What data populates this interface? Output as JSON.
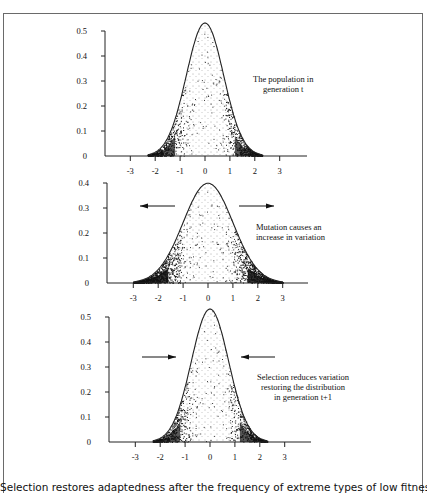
{
  "figure": {
    "caption": "Selection restores adaptedness after the frequency of extreme types of low fitness"
  },
  "panels": [
    {
      "annotation_lines": [
        "The population in",
        "generation t"
      ],
      "arrows": "none"
    },
    {
      "annotation_lines": [
        "Mutation causes an",
        "increase in variation"
      ],
      "arrows": "outward"
    },
    {
      "annotation_lines": [
        "Selection reduces variation",
        "restoring the distribution",
        "in generation t+1"
      ],
      "arrows": "inward"
    }
  ],
  "chart_data": [
    {
      "type": "area",
      "title": "The population in generation t",
      "xlabel": "",
      "ylabel": "",
      "x_ticks": [
        -3,
        -2,
        -1,
        0,
        1,
        2,
        3
      ],
      "y_ticks": [
        0,
        0.1,
        0.2,
        0.3,
        0.4,
        0.5
      ],
      "ylim": [
        0,
        0.5
      ],
      "series": [
        {
          "name": "normal density",
          "mean": 0,
          "sd": 0.75,
          "peak": 0.53
        }
      ],
      "annotations": [
        "The population in generation t"
      ],
      "grid": false
    },
    {
      "type": "area",
      "title": "Mutation causes an increase in variation",
      "xlabel": "",
      "ylabel": "",
      "x_ticks": [
        -3,
        -2,
        -1,
        0,
        1,
        2,
        3
      ],
      "y_ticks": [
        0,
        0.1,
        0.2,
        0.3,
        0.4
      ],
      "ylim": [
        0,
        0.4
      ],
      "series": [
        {
          "name": "normal density",
          "mean": 0,
          "sd": 1.0,
          "peak": 0.4
        }
      ],
      "annotations": [
        "Mutation causes an increase in variation",
        "arrows pointing outward"
      ],
      "grid": false
    },
    {
      "type": "area",
      "title": "Selection reduces variation restoring the distribution in generation t+1",
      "xlabel": "",
      "ylabel": "",
      "x_ticks": [
        -3,
        -2,
        -1,
        0,
        1,
        2,
        3
      ],
      "y_ticks": [
        0,
        0.1,
        0.2,
        0.3,
        0.4,
        0.5
      ],
      "ylim": [
        0,
        0.5
      ],
      "series": [
        {
          "name": "normal density",
          "mean": 0,
          "sd": 0.75,
          "peak": 0.53
        }
      ],
      "annotations": [
        "Selection reduces variation restoring the distribution in generation t+1",
        "arrows pointing inward"
      ],
      "grid": false
    }
  ]
}
